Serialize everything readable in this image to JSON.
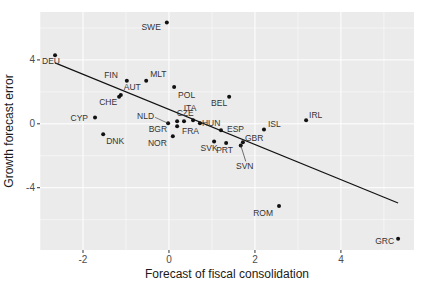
{
  "chart_data": {
    "type": "scatter",
    "title": "",
    "xlabel": "Forecast of fiscal consolidation",
    "ylabel": "Growth forecast error",
    "xlim": [
      -3.0,
      5.7
    ],
    "ylim": [
      -7.9,
      7.0
    ],
    "x_ticks": [
      -2,
      0,
      2,
      4
    ],
    "x_tick_labels": [
      "-2",
      "0",
      "2",
      "4"
    ],
    "y_ticks": [
      -4,
      0,
      4
    ],
    "y_tick_labels": [
      "-4",
      "0",
      "4"
    ],
    "grid": true,
    "colors": {
      "panel": "#ebebeb",
      "grid": "#ffffff",
      "points": "#111111",
      "line": "#111111"
    },
    "points": [
      {
        "label": "DEU",
        "x": -2.65,
        "y": 4.3
      },
      {
        "label": "SWE",
        "x": -0.05,
        "y": 6.35
      },
      {
        "label": "FIN",
        "x": -0.98,
        "y": 2.7
      },
      {
        "label": "MLT",
        "x": -0.53,
        "y": 2.7
      },
      {
        "label": "AUT",
        "x": -1.12,
        "y": 1.8
      },
      {
        "label": "CHE",
        "x": -1.16,
        "y": 1.7
      },
      {
        "label": "POL",
        "x": 0.12,
        "y": 2.3
      },
      {
        "label": "CYP",
        "x": -1.72,
        "y": 0.4
      },
      {
        "label": "DNK",
        "x": -1.53,
        "y": -0.65
      },
      {
        "label": "BEL",
        "x": 1.4,
        "y": 1.7
      },
      {
        "label": "NLD",
        "x": -0.02,
        "y": 0.03
      },
      {
        "label": "CZE",
        "x": 0.19,
        "y": 0.16
      },
      {
        "label": "BGR",
        "x": 0.19,
        "y": -0.16
      },
      {
        "label": "FRA",
        "x": 0.35,
        "y": 0.16
      },
      {
        "label": "ITA",
        "x": 0.56,
        "y": 0.22
      },
      {
        "label": "HUN",
        "x": 0.72,
        "y": 0.03
      },
      {
        "label": "NOR",
        "x": 0.09,
        "y": -0.78
      },
      {
        "label": "ESP",
        "x": 1.21,
        "y": -0.4
      },
      {
        "label": "SVK",
        "x": 1.05,
        "y": -1.1
      },
      {
        "label": "PRT",
        "x": 1.33,
        "y": -1.2
      },
      {
        "label": "GBR",
        "x": 1.72,
        "y": -1.15
      },
      {
        "label": "SVN",
        "x": 1.67,
        "y": -1.35
      },
      {
        "label": "ISL",
        "x": 2.21,
        "y": -0.35
      },
      {
        "label": "IRL",
        "x": 3.19,
        "y": 0.22
      },
      {
        "label": "ROM",
        "x": 2.56,
        "y": -5.15
      },
      {
        "label": "GRC",
        "x": 5.33,
        "y": -7.2
      }
    ],
    "fit_line": {
      "type": "linear",
      "intercept": 0.9,
      "slope": -1.1,
      "x_range": [
        -2.65,
        5.33
      ]
    },
    "label_offsets": {
      "DEU": [
        -13,
        9,
        "start"
      ],
      "SWE": [
        -6,
        8,
        "end"
      ],
      "FIN": [
        -9,
        -3,
        "end"
      ],
      "MLT": [
        4,
        -4,
        "start"
      ],
      "AUT": [
        3,
        -5,
        "start"
      ],
      "CHE": [
        -2,
        8,
        "end"
      ],
      "POL": [
        4,
        11,
        "start"
      ],
      "CYP": [
        -7,
        4,
        "end"
      ],
      "DNK": [
        3,
        10,
        "start"
      ],
      "BEL": [
        -2,
        9,
        "end"
      ],
      "NLD": [
        -14,
        -4,
        "end"
      ],
      "CZE": [
        8,
        -5,
        "middle"
      ],
      "BGR": [
        -10,
        6,
        "end"
      ],
      "FRA": [
        -2,
        13,
        "start"
      ],
      "ITA": [
        -3,
        -9,
        "middle"
      ],
      "HUN": [
        2,
        3,
        "start"
      ],
      "NOR": [
        -6,
        10,
        "end"
      ],
      "ESP": [
        6,
        2,
        "start"
      ],
      "SVK": [
        -5,
        10,
        "middle"
      ],
      "PRT": [
        -10,
        10,
        "start"
      ],
      "GBR": [
        2,
        -1,
        "start"
      ],
      "SVN": [
        4,
        24,
        "middle"
      ],
      "ISL": [
        4,
        -2,
        "start"
      ],
      "IRL": [
        3,
        -2,
        "start"
      ],
      "ROM": [
        -6,
        10,
        "end"
      ],
      "GRC": [
        -4,
        5,
        "end"
      ]
    }
  }
}
